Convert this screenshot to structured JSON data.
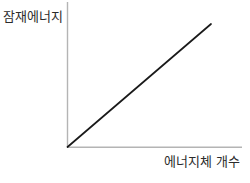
{
  "chart_data": {
    "type": "line",
    "title": "",
    "subtitle": "",
    "xlabel": "에너지체 개수",
    "ylabel": "잠재에너지",
    "series": [
      {
        "name": "잠재에너지",
        "x": [
          0,
          1
        ],
        "values": [
          0,
          1
        ],
        "color": "#1a1a1a"
      }
    ],
    "x": [
      0,
      1
    ],
    "xlim": [
      0,
      1.21
    ],
    "ylim": [
      0,
      1.18
    ],
    "xticks": [],
    "yticks": [],
    "xticklabels": [],
    "yticklabels": [],
    "grid": false,
    "legend": false,
    "legend_position": "none",
    "annotations": [],
    "axis_color": "#b4b4b4",
    "line_color": "#1a1a1a",
    "background_color": "#ffffff",
    "text_color": "#2b2b2b"
  },
  "figure": {
    "ylabel": "잠재에너지",
    "xlabel": "에너지체 개수"
  }
}
